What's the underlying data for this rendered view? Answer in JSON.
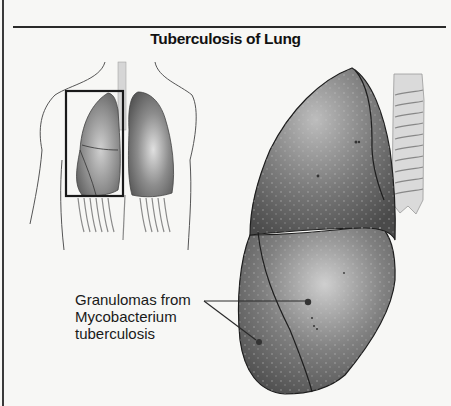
{
  "figure": {
    "title": "Tuberculosis of Lung",
    "caption_lines": [
      "Granulomas from",
      "Mycobacterium",
      "tuberculosis"
    ],
    "panels": {
      "overview": "torso-with-lungs-right-lung-highlighted",
      "detail": "enlarged-right-lung-with-trachea"
    },
    "colors": {
      "background": "#f7f7f5",
      "lung_dark": "#5a5a5a",
      "lung_light": "#a8a8a8",
      "outline": "#1e1e1e",
      "trachea": "#d9d9d9"
    }
  }
}
